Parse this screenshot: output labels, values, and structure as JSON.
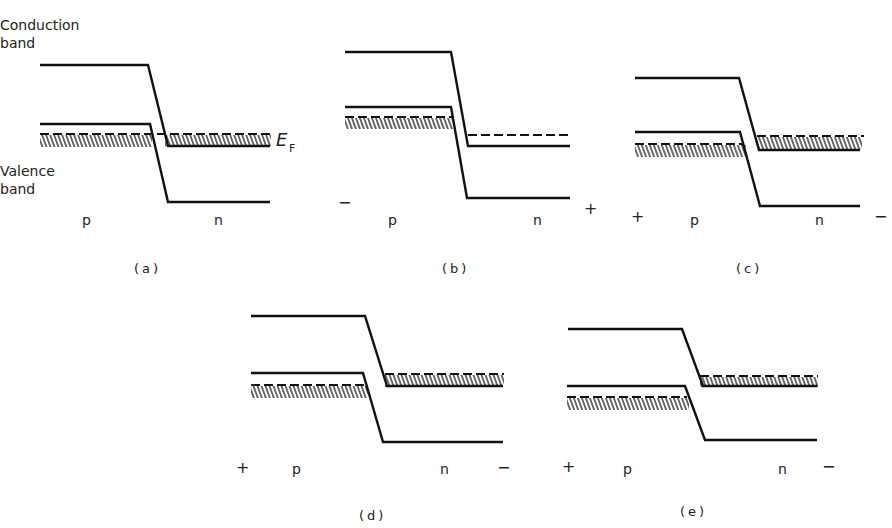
{
  "labels": {
    "conduction_band_line1": "Conduction",
    "conduction_band_line2": "band",
    "valence_band_line1": "Valence",
    "valence_band_line2": "band",
    "fermi_level": "E",
    "fermi_subscript": "F"
  },
  "panels": [
    {
      "id": "a",
      "caption": "(a)",
      "left_region": "p",
      "right_region": "n",
      "left_sign": "",
      "right_sign": "",
      "description": "Equilibrium, no bias; Fermi level flat across junction"
    },
    {
      "id": "b",
      "caption": "(b)",
      "left_region": "p",
      "right_region": "n",
      "left_sign": "−",
      "right_sign": "+",
      "description": "Reverse bias"
    },
    {
      "id": "c",
      "caption": "(c)",
      "left_region": "p",
      "right_region": "n",
      "left_sign": "+",
      "right_sign": "−",
      "description": "Small forward bias"
    },
    {
      "id": "d",
      "caption": "(d)",
      "left_region": "p",
      "right_region": "n",
      "left_sign": "+",
      "right_sign": "−",
      "description": "Larger forward bias"
    },
    {
      "id": "e",
      "caption": "(e)",
      "left_region": "p",
      "right_region": "n",
      "left_sign": "+",
      "right_sign": "−",
      "description": "Large forward bias; filled states no longer overlap"
    }
  ],
  "colors": {
    "ink": "#111111",
    "background": "#ffffff"
  }
}
